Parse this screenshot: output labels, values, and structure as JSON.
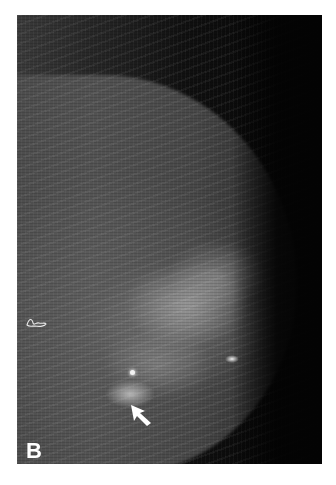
{
  "figure": {
    "panel_label": "B",
    "annotations": {
      "arrow": "arrow-pointer",
      "skin_marker": "scar-marker"
    },
    "colors": {
      "background": "#ffffff",
      "image_dark": "#050505",
      "label": "#ffffff"
    }
  }
}
